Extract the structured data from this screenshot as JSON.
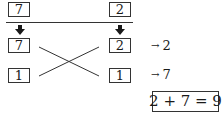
{
  "diagram": {
    "left": {
      "top_value": "7",
      "middle_value": "7",
      "bottom_value": "1"
    },
    "right": {
      "top_value": "2",
      "middle_value": "2",
      "bottom_value": "1"
    },
    "results": [
      {
        "arrow": "→",
        "value": "2"
      },
      {
        "arrow": "→",
        "value": "7"
      }
    ],
    "equation": "2 + 7 = 9",
    "colors": {
      "stroke": "#333333",
      "background": "#ffffff"
    }
  }
}
